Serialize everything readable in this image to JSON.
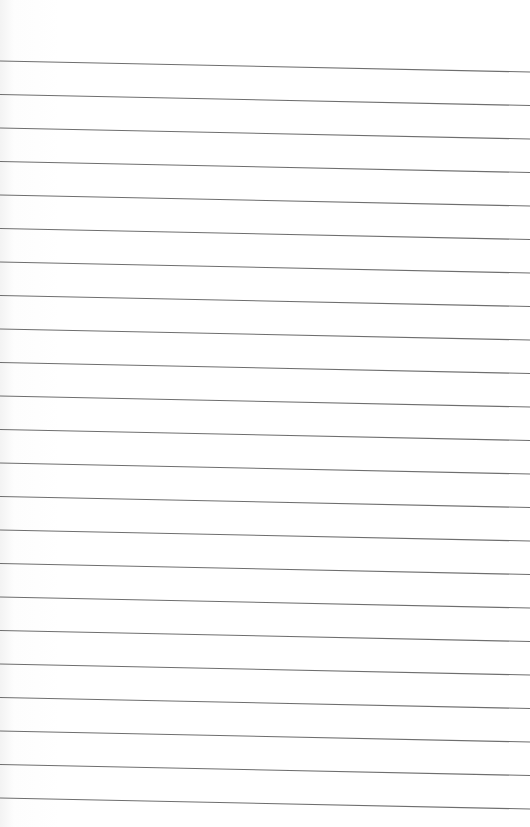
{
  "page": {
    "type": "lined-paper",
    "background_color": "#ffffff",
    "line_color": "#6e6e6e",
    "line_count": 23,
    "first_line_y_left": 61,
    "line_spacing": 33.5,
    "slope_offset_right": 11,
    "text_content": []
  }
}
